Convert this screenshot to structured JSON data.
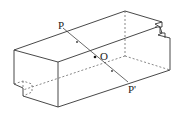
{
  "diagram": {
    "type": "3d-rectangular-box",
    "labels": {
      "p": "P",
      "o": "O",
      "p_prime": "P'"
    },
    "colors": {
      "stroke": "#333333",
      "hidden_stroke": "#555555",
      "background": "#ffffff"
    }
  }
}
